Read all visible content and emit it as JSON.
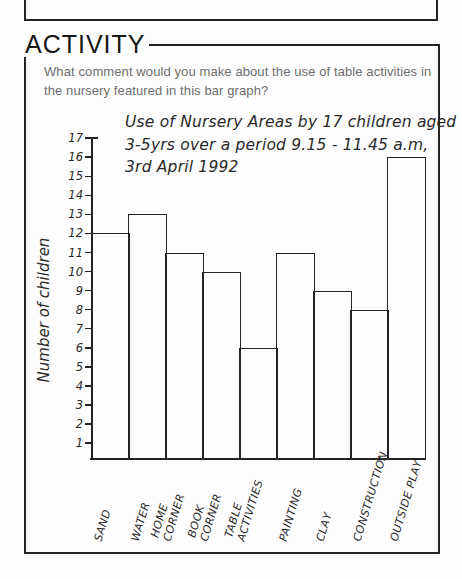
{
  "header": {
    "heading": "ACTIVITY"
  },
  "question": {
    "lines": [
      "What comment would you make about the use of table activities in",
      "the nursery featured in this bar graph?"
    ]
  },
  "chart_data": {
    "type": "bar",
    "title": "Use of Nursery Areas by 17 children aged 3-5yrs over a period 9.15 - 11.45 a.m, 3rd April 1992",
    "title_lines": [
      "Use of Nursery Areas by 17 children aged",
      "3-5yrs over a period 9.15 - 11.45 a.m,",
      "3rd April 1992"
    ],
    "ylabel": "Number of children",
    "xlabel": "",
    "categories": [
      "Sand",
      "Water",
      "Home Corner",
      "Book Corner",
      "Table Activities",
      "Painting",
      "Clay",
      "Construction",
      "Outside Play"
    ],
    "category_labels": [
      [
        "SAND"
      ],
      [
        "WATER"
      ],
      [
        "HOME",
        "CORNER"
      ],
      [
        "BOOK",
        "CORNER"
      ],
      [
        "TABLE",
        "ACTIVITIES"
      ],
      [
        "PAINTING"
      ],
      [
        "CLAY"
      ],
      [
        "CONSTRUCTION"
      ],
      [
        "OUTSIDE PLAY"
      ]
    ],
    "values": [
      12,
      13,
      11,
      10,
      6,
      11,
      9,
      8,
      16
    ],
    "y_ticks": [
      1,
      2,
      3,
      4,
      5,
      6,
      7,
      8,
      9,
      10,
      11,
      12,
      13,
      14,
      15,
      16,
      17
    ],
    "ylim": [
      0,
      17
    ],
    "grid": false,
    "legend_position": "none",
    "style": "hand-drawn"
  },
  "colors": {
    "ink": "#242424",
    "question_text": "#6e6e6e",
    "paper": "#fdfdfd",
    "bar_fill": "#fdfdfd"
  }
}
